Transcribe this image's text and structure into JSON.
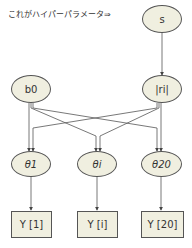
{
  "annotation": {
    "text": "これがハイパーパラメータ⇒"
  },
  "nodes": {
    "s": {
      "label": "s"
    },
    "b0": {
      "label": "b0"
    },
    "ri": {
      "label": "|ri|"
    },
    "theta1": {
      "label": "θ1"
    },
    "thetai": {
      "label": "θi"
    },
    "theta20": {
      "label": "θ20"
    },
    "y1": {
      "label": "Y [1]"
    },
    "yi": {
      "label": "Y [i]"
    },
    "y20": {
      "label": "Y [20]"
    }
  },
  "edges": [
    [
      "s",
      "ri"
    ],
    [
      "b0",
      "theta1"
    ],
    [
      "b0",
      "thetai"
    ],
    [
      "b0",
      "theta20"
    ],
    [
      "ri",
      "theta1"
    ],
    [
      "ri",
      "thetai"
    ],
    [
      "ri",
      "theta20"
    ],
    [
      "theta1",
      "y1"
    ],
    [
      "thetai",
      "yi"
    ],
    [
      "theta20",
      "y20"
    ]
  ],
  "colors": {
    "node_fill": "#f0efe0",
    "stroke": "#555555",
    "background": "#ffffff"
  }
}
